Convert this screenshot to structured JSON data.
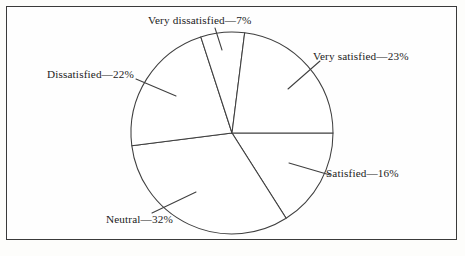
{
  "figure": {
    "background_color": "#fdfdfb",
    "frame_color": "#3a3a3a",
    "line_color": "#3f3f3f"
  },
  "chart_data": {
    "type": "pie",
    "title": "",
    "xlabel": "",
    "ylabel": "",
    "legend_position": "none",
    "grid": false,
    "center": {
      "x": 232,
      "y": 133
    },
    "radius": 101,
    "start_angle_deg": 0,
    "direction": "clockwise",
    "categories": [
      "Satisfied",
      "Neutral",
      "Dissatisfied",
      "Very dissatisfied",
      "Very satisfied"
    ],
    "values": [
      16,
      32,
      22,
      7,
      23
    ],
    "units": "%",
    "slices": [
      {
        "name": "satisfied",
        "category": "Satisfied",
        "value": 16,
        "label": "Satisfied—16%",
        "start_angle_deg": 0,
        "end_angle_deg": 57.6
      },
      {
        "name": "neutral",
        "category": "Neutral",
        "value": 32,
        "label": "Neutral—32%",
        "start_angle_deg": 57.6,
        "end_angle_deg": 172.8
      },
      {
        "name": "dissatisfied",
        "category": "Dissatisfied",
        "value": 22,
        "label": "Dissatisfied—22%",
        "start_angle_deg": 172.8,
        "end_angle_deg": 252.0
      },
      {
        "name": "very-dissatisfied",
        "category": "Very dissatisfied",
        "value": 7,
        "label": "Very dissatisfied—7%",
        "start_angle_deg": 252.0,
        "end_angle_deg": 277.2
      },
      {
        "name": "very-satisfied",
        "category": "Very satisfied",
        "value": 23,
        "label": "Very satisfied—23%",
        "start_angle_deg": 277.2,
        "end_angle_deg": 360.0
      }
    ],
    "leader_lines": [
      {
        "name": "very-dissatisfied",
        "x1": 222,
        "y1": 50,
        "x2": 215,
        "y2": 28
      },
      {
        "name": "very-satisfied",
        "x1": 288,
        "y1": 89,
        "x2": 320,
        "y2": 61
      },
      {
        "name": "satisfied",
        "x1": 289,
        "y1": 163,
        "x2": 330,
        "y2": 175
      },
      {
        "name": "neutral",
        "x1": 196,
        "y1": 192,
        "x2": 152,
        "y2": 213
      },
      {
        "name": "dissatisfied",
        "x1": 176,
        "y1": 96,
        "x2": 136,
        "y2": 79
      }
    ]
  }
}
